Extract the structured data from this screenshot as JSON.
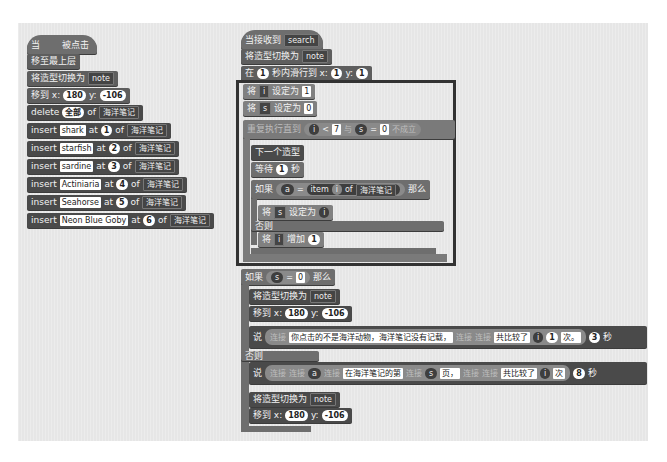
{
  "left_script": {
    "hat": {
      "prefix": "当",
      "suffix": "被点击"
    },
    "go_front": "移至最上层",
    "switch_costume": {
      "label": "将造型切换为",
      "costume": "note"
    },
    "goto": {
      "label": "移到 x:",
      "x": "180",
      "ylabel": "y:",
      "y": "-106"
    },
    "delete": {
      "label": "delete",
      "index": "全部",
      "of": "of",
      "list": "海洋笔记"
    },
    "inserts": [
      {
        "label": "insert",
        "item": "shark",
        "at": "at",
        "index": "1",
        "of": "of",
        "list": "海洋笔记"
      },
      {
        "label": "insert",
        "item": "starfish",
        "at": "at",
        "index": "2",
        "of": "of",
        "list": "海洋笔记"
      },
      {
        "label": "insert",
        "item": "sardine",
        "at": "at",
        "index": "3",
        "of": "of",
        "list": "海洋笔记"
      },
      {
        "label": "insert",
        "item": "Actiniaria",
        "at": "at",
        "index": "4",
        "of": "of",
        "list": "海洋笔记"
      },
      {
        "label": "insert",
        "item": "Seahorse",
        "at": "at",
        "index": "5",
        "of": "of",
        "list": "海洋笔记"
      },
      {
        "label": "insert",
        "item": "Neon Blue Goby",
        "at": "at",
        "index": "6",
        "of": "of",
        "list": "海洋笔记"
      }
    ]
  },
  "right_script": {
    "hat": {
      "label": "当接收到",
      "message": "search"
    },
    "switch_costume": {
      "label": "将造型切换为",
      "costume": "note"
    },
    "glide": {
      "prefix": "在",
      "secs": "1",
      "mid": "秒内滑行到 x:",
      "x": "1",
      "ylabel": "y:",
      "y": "1"
    },
    "set_i": {
      "label": "将",
      "var": "i",
      "mid": "设定为",
      "value": "1"
    },
    "set_s": {
      "label": "将",
      "var": "s",
      "mid": "设定为",
      "value": "0"
    },
    "repeat_until": {
      "label": "重复执行直到",
      "var1": "i",
      "op1": "<",
      "val1": "7",
      "and": "与",
      "var2": "s",
      "op2": "=",
      "val2": "0",
      "not": "不成立"
    },
    "next_costume": "下一个造型",
    "wait": {
      "label": "等待",
      "secs": "1",
      "unit": "秒"
    },
    "if_inner": {
      "label": "如果",
      "var": "a",
      "op": "=",
      "item": "item",
      "idx": "i",
      "of": "of",
      "list": "海洋笔记",
      "then": "那么"
    },
    "set_s_i": {
      "label": "将",
      "var": "s",
      "mid": "设定为",
      "value": "i"
    },
    "else_inner": "否则",
    "change_i": {
      "label": "将",
      "var": "i",
      "mid": "增加",
      "value": "1"
    },
    "if_outer": {
      "label": "如果",
      "var": "s",
      "op": "=",
      "val": "0",
      "then": "那么"
    },
    "switch_costume2": {
      "label": "将造型切换为",
      "costume": "note"
    },
    "goto2": {
      "label": "移到 x:",
      "x": "180",
      "ylabel": "y:",
      "y": "-106"
    },
    "say1": {
      "label": "说",
      "join": "连接",
      "text": "你点击的不是海洋动物，海洋笔记没有记载，",
      "join2": "连接",
      "join3": "连接",
      "text2": "共比较了",
      "var": "i",
      "num": "1",
      "text3": "次。",
      "secs": "3",
      "unit": "秒"
    },
    "else_outer": "否则",
    "say2": {
      "label": "说",
      "join": "连接",
      "join2": "连接",
      "var": "a",
      "join3": "连接",
      "text": "在海洋笔记的第",
      "join4": "连接",
      "var2": "s",
      "text2": "页，",
      "join5": "连接",
      "join6": "连接",
      "text3": "共比较了",
      "var3": "i",
      "text4": "次",
      "secs": "8",
      "unit": "秒"
    },
    "switch_costume3": {
      "label": "将造型切换为",
      "costume": "note"
    },
    "goto3": {
      "label": "移到 x:",
      "x": "180",
      "ylabel": "y:",
      "y": "-106"
    }
  }
}
